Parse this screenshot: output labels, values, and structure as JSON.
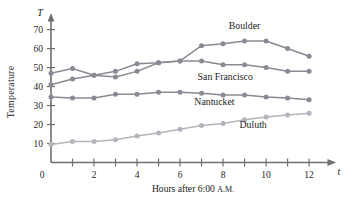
{
  "chart_data": {
    "type": "line",
    "title": "",
    "xlabel": "Hours after 6:00 A.M.",
    "ylabel": "Temperature",
    "x_axis_variable": "t",
    "y_axis_variable": "T",
    "x": [
      0,
      1,
      2,
      3,
      4,
      5,
      6,
      7,
      8,
      9,
      10,
      11,
      12
    ],
    "xlim": [
      0,
      12.6
    ],
    "ylim": [
      0,
      74
    ],
    "xticks": [
      0,
      1,
      2,
      3,
      4,
      5,
      6,
      7,
      8,
      9,
      10,
      11,
      12
    ],
    "xtick_labels": [
      "0",
      "",
      "2",
      "",
      "4",
      "",
      "6",
      "",
      "8",
      "",
      "10",
      "",
      "12"
    ],
    "yticks": [
      10,
      20,
      30,
      40,
      50,
      60,
      70
    ],
    "ytick_labels": [
      "10",
      "20",
      "30",
      "40",
      "50",
      "60",
      "70"
    ],
    "grid": false,
    "legend_position": "inline-annotations",
    "series": [
      {
        "name": "Boulder",
        "color": "#8a8a94",
        "label_annotation": "Boulder",
        "values": [
          41,
          44,
          46,
          45,
          48,
          52.5,
          53.5,
          61.5,
          62.5,
          64,
          64,
          60,
          56
        ]
      },
      {
        "name": "San Francisco",
        "color": "#8a8a94",
        "label_annotation": "San Francisco",
        "values": [
          47,
          49.5,
          46,
          48,
          52,
          52.5,
          53.5,
          53.5,
          51.5,
          51.5,
          50,
          48,
          48
        ]
      },
      {
        "name": "Nantucket",
        "color": "#8a8a94",
        "label_annotation": "Nantucket",
        "values": [
          34.5,
          34,
          34,
          36,
          36,
          37,
          37,
          36.5,
          35.5,
          35.5,
          34.5,
          34,
          33
        ]
      },
      {
        "name": "Duluth",
        "color": "#b4b4bc",
        "label_annotation": "Duluth",
        "values": [
          9.5,
          11,
          11,
          12,
          14,
          15.5,
          17.5,
          19.5,
          20.5,
          22.5,
          24,
          25,
          26
        ]
      }
    ],
    "annotations": [
      {
        "text": "Boulder",
        "x": 9.0,
        "y": 70.5
      },
      {
        "text": "San Francisco",
        "x": 8.1,
        "y": 43.5
      },
      {
        "text": "Nantucket",
        "x": 7.6,
        "y": 30.5
      },
      {
        "text": "Duluth",
        "x": 9.4,
        "y": 18.0
      }
    ]
  }
}
